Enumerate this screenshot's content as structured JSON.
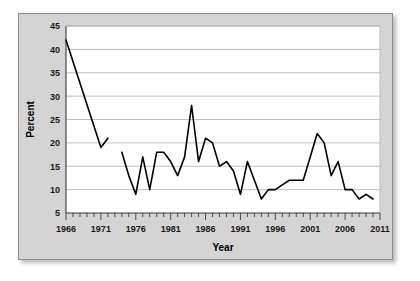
{
  "chart_data": {
    "type": "line",
    "title": "",
    "xlabel": "Year",
    "ylabel": "Percent",
    "xlim": [
      1966,
      2011
    ],
    "ylim": [
      5,
      45
    ],
    "ytick_step": 5,
    "xtick_step": 1,
    "xlabel_step": 5,
    "grid": true,
    "legend": "none",
    "line_color": "#000000",
    "plot_background": "#ffffff",
    "panel_background": "#d4d4d4",
    "gridline_color": "#b0b0b0",
    "ytick_labels": [
      "5",
      "10",
      "15",
      "20",
      "25",
      "30",
      "35",
      "40",
      "45"
    ],
    "ytick_values": [
      5,
      10,
      15,
      20,
      25,
      30,
      35,
      40,
      45
    ],
    "xtick_labels": [
      "1966",
      "1971",
      "1976",
      "1981",
      "1986",
      "1991",
      "1996",
      "2001",
      "2006",
      "2011"
    ],
    "xtick_values": [
      1966,
      1971,
      1976,
      1981,
      1986,
      1991,
      1996,
      2001,
      2006,
      2011
    ],
    "series": [
      {
        "name": "Percent",
        "segments": [
          {
            "x": [
              1966,
              1971,
              1972
            ],
            "y": [
              42,
              19,
              21
            ]
          },
          {
            "x": [
              1974,
              1975,
              1976,
              1977,
              1978,
              1979,
              1980,
              1981,
              1982,
              1983,
              1984,
              1985,
              1986,
              1987,
              1988,
              1989,
              1990,
              1991,
              1992,
              1993,
              1994,
              1995,
              1996,
              1997,
              1998,
              1999,
              2000,
              2001,
              2002,
              2003,
              2004,
              2005,
              2006,
              2007,
              2008,
              2009,
              2010
            ],
            "y": [
              18,
              13,
              9,
              17,
              10,
              18,
              18,
              16,
              13,
              17,
              28,
              16,
              21,
              20,
              15,
              16,
              14,
              9,
              16,
              12,
              8,
              10,
              10,
              11,
              12,
              12,
              12,
              17,
              22,
              20,
              13,
              16,
              10,
              10,
              8,
              9,
              8
            ]
          }
        ]
      }
    ]
  }
}
